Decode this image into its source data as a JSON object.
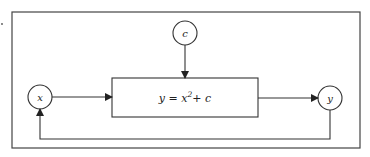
{
  "diagram": {
    "nodes": {
      "input": {
        "label": "x"
      },
      "constant": {
        "label": "c"
      },
      "output": {
        "label": "y"
      }
    },
    "function_box": {
      "equation_prefix": "y = x",
      "exponent": "2",
      "equation_suffix": "+ c"
    },
    "edges": [
      {
        "from": "x",
        "to": "function_box"
      },
      {
        "from": "c",
        "to": "function_box"
      },
      {
        "from": "function_box",
        "to": "y"
      },
      {
        "from": "y",
        "to": "x",
        "type": "feedback"
      }
    ],
    "stroke_color": "#333333"
  }
}
